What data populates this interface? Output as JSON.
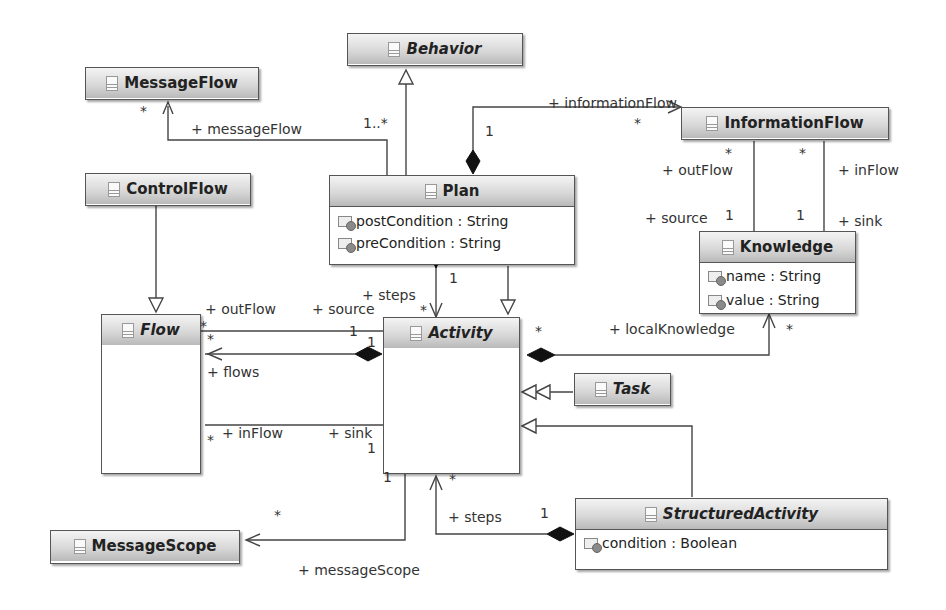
{
  "diagram": {
    "type": "UML class diagram",
    "classes": {
      "behavior": {
        "name": "Behavior",
        "abstract": true,
        "attributes": []
      },
      "messageflow": {
        "name": "MessageFlow",
        "abstract": false,
        "attributes": []
      },
      "informationflow": {
        "name": "InformationFlow",
        "abstract": false,
        "attributes": []
      },
      "controlflow": {
        "name": "ControlFlow",
        "abstract": false,
        "attributes": []
      },
      "plan": {
        "name": "Plan",
        "abstract": false,
        "attributes": [
          "postCondition : String",
          "preCondition : String"
        ]
      },
      "knowledge": {
        "name": "Knowledge",
        "abstract": false,
        "attributes": [
          "name : String",
          "value : String"
        ]
      },
      "flow": {
        "name": "Flow",
        "abstract": true,
        "attributes": []
      },
      "activity": {
        "name": "Activity",
        "abstract": true,
        "attributes": []
      },
      "task": {
        "name": "Task",
        "abstract": true,
        "attributes": []
      },
      "messagescope": {
        "name": "MessageScope",
        "abstract": false,
        "attributes": []
      },
      "structuredactivity": {
        "name": "StructuredActivity",
        "abstract": true,
        "attributes": [
          "condition : Boolean"
        ]
      }
    },
    "labels": {
      "informationFlow_role": "+ informationFlow",
      "informationFlow_src_mult": "1",
      "informationFlow_tgt_mult": "*",
      "messageFlow_role": "+ messageFlow",
      "messageFlow_tgt_mult": "*",
      "messageFlow_src_mult": "1..*",
      "outFlow_role_if": "+ outFlow",
      "outFlow_mult_if": "*",
      "inFlow_role_if": "+ inFlow",
      "inFlow_mult_if": "*",
      "source_role_k": "+ source",
      "source_mult_k": "1",
      "sink_role_k": "+ sink",
      "sink_mult_k": "1",
      "steps_role_plan": "+ steps",
      "steps_mult_plan_top": "1",
      "steps_mult_plan_bottom": "*",
      "outFlow_role_flow": "+ outFlow",
      "source_role_flow": "+ source",
      "outFlow_mult_flow": "*",
      "source_mult_flow": "1",
      "flows_mult_flow": "*",
      "flows_mult_activity": "1",
      "flows_role": "+ flows",
      "inFlow_role_flow": "+ inFlow",
      "inFlow_mult_flow": "*",
      "sink_role_flow": "+ sink",
      "sink_mult_flow": "1",
      "localKnowledge_role": "+ localKnowledge",
      "localKnowledge_src_mult": "*",
      "localKnowledge_tgt_mult": "*",
      "messageScope_role": "+ messageScope",
      "messageScope_tgt_mult": "*",
      "messageScope_src_mult": "1",
      "steps_role_sa": "+ steps",
      "steps_mult_sa_activity": "*",
      "steps_mult_sa": "1"
    }
  }
}
